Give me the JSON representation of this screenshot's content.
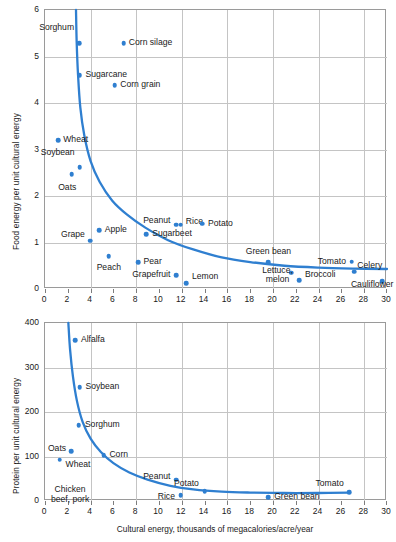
{
  "figure": {
    "background": "#ffffff",
    "accent": "#2f7fd0",
    "grid_color": "#c4c4c4",
    "axis_color": "#9a9a9a"
  },
  "chart_data": [
    {
      "id": "food-energy",
      "type": "scatter",
      "title": "",
      "xlabel": "",
      "ylabel": "Food energy per unit cultural energy",
      "xlim": [
        0,
        30
      ],
      "ylim": [
        0,
        6
      ],
      "xticks": [
        0,
        2,
        4,
        6,
        8,
        10,
        12,
        14,
        16,
        18,
        20,
        22,
        24,
        26,
        28,
        30
      ],
      "yticks": [
        0,
        1,
        2,
        3,
        4,
        5,
        6
      ],
      "grid": true,
      "legend": "none",
      "points": [
        {
          "label": "Sorghum",
          "x": 3.0,
          "y": 5.28,
          "lx": 2.55,
          "ly": 5.62,
          "align": "r"
        },
        {
          "label": "Corn silage",
          "x": 6.9,
          "y": 5.28,
          "lx": 7.35,
          "ly": 5.28,
          "align": "l"
        },
        {
          "label": "Sugarcane",
          "x": 3.05,
          "y": 4.6,
          "lx": 3.55,
          "ly": 4.6,
          "align": "l"
        },
        {
          "label": "Corn grain",
          "x": 6.1,
          "y": 4.38,
          "lx": 6.6,
          "ly": 4.38,
          "align": "l"
        },
        {
          "label": "Wheat",
          "x": 1.15,
          "y": 3.2,
          "lx": 1.6,
          "ly": 3.2,
          "align": "l"
        },
        {
          "label": "Soybean",
          "x": 3.05,
          "y": 2.62,
          "lx": 2.6,
          "ly": 2.93,
          "align": "r"
        },
        {
          "label": "Oats",
          "x": 2.35,
          "y": 2.47,
          "lx": 2.75,
          "ly": 2.18,
          "align": "r"
        },
        {
          "label": "Grape",
          "x": 3.95,
          "y": 1.04,
          "lx": 3.5,
          "ly": 1.16,
          "align": "r"
        },
        {
          "label": "Apple",
          "x": 4.75,
          "y": 1.26,
          "lx": 5.25,
          "ly": 1.26,
          "align": "l"
        },
        {
          "label": "Peanut",
          "x": 11.5,
          "y": 1.38,
          "lx": 11.0,
          "ly": 1.47,
          "align": "r"
        },
        {
          "label": "Sugarbeet",
          "x": 8.9,
          "y": 1.18,
          "lx": 9.4,
          "ly": 1.18,
          "align": "l"
        },
        {
          "label": "Rice",
          "x": 11.9,
          "y": 1.38,
          "lx": 12.35,
          "ly": 1.44,
          "align": "l"
        },
        {
          "label": "Potato",
          "x": 13.8,
          "y": 1.4,
          "lx": 14.3,
          "ly": 1.4,
          "align": "l"
        },
        {
          "label": "Peach",
          "x": 5.6,
          "y": 0.71,
          "lx": 5.6,
          "ly": 0.46,
          "align": "c"
        },
        {
          "label": "Pear",
          "x": 8.15,
          "y": 0.57,
          "lx": 8.65,
          "ly": 0.57,
          "align": "l"
        },
        {
          "label": "Grapefruit",
          "x": 11.5,
          "y": 0.3,
          "lx": 11.0,
          "ly": 0.3,
          "align": "r"
        },
        {
          "label": "Lemon",
          "x": 12.4,
          "y": 0.13,
          "lx": 12.9,
          "ly": 0.26,
          "align": "l"
        },
        {
          "label": "Green bean",
          "x": 19.6,
          "y": 0.57,
          "lx": 19.6,
          "ly": 0.79,
          "align": "c"
        },
        {
          "label": "Lettuce,\nmelon",
          "x": 21.6,
          "y": 0.35,
          "lx": 20.4,
          "ly": 0.31,
          "align": "c"
        },
        {
          "label": "Broccoli",
          "x": 22.3,
          "y": 0.19,
          "lx": 22.8,
          "ly": 0.31,
          "align": "l"
        },
        {
          "label": "Tomato",
          "x": 26.9,
          "y": 0.59,
          "lx": 26.4,
          "ly": 0.59,
          "align": "r"
        },
        {
          "label": "Celery",
          "x": 27.1,
          "y": 0.37,
          "lx": 27.4,
          "ly": 0.5,
          "align": "l"
        },
        {
          "label": "Cauliflower",
          "x": 29.6,
          "y": 0.17,
          "lx": 28.7,
          "ly": 0.08,
          "align": "c"
        }
      ],
      "curve": [
        {
          "x": 2.72,
          "y": 6.0
        },
        {
          "x": 2.78,
          "y": 5.3
        },
        {
          "x": 2.9,
          "y": 4.6
        },
        {
          "x": 3.1,
          "y": 3.9
        },
        {
          "x": 3.45,
          "y": 3.3
        },
        {
          "x": 4.0,
          "y": 2.75
        },
        {
          "x": 4.8,
          "y": 2.3
        },
        {
          "x": 5.9,
          "y": 1.9
        },
        {
          "x": 7.2,
          "y": 1.6
        },
        {
          "x": 8.8,
          "y": 1.32
        },
        {
          "x": 10.8,
          "y": 1.05
        },
        {
          "x": 13.0,
          "y": 0.85
        },
        {
          "x": 15.5,
          "y": 0.68
        },
        {
          "x": 18.0,
          "y": 0.58
        },
        {
          "x": 21.0,
          "y": 0.5
        },
        {
          "x": 24.0,
          "y": 0.46
        },
        {
          "x": 27.0,
          "y": 0.44
        },
        {
          "x": 30.0,
          "y": 0.43
        }
      ]
    },
    {
      "id": "protein",
      "type": "scatter",
      "title": "",
      "xlabel": "Cultural energy, thousands of megacalories/acre/year",
      "ylabel": "Protein per unit cultural energy",
      "xlim": [
        0,
        30
      ],
      "ylim": [
        0,
        400
      ],
      "xticks": [
        0,
        2,
        4,
        6,
        8,
        10,
        12,
        14,
        16,
        18,
        20,
        22,
        24,
        26,
        28,
        30
      ],
      "yticks": [
        0,
        100,
        200,
        300,
        400
      ],
      "grid": true,
      "legend": "none",
      "points": [
        {
          "label": "Alfalfa",
          "x": 2.65,
          "y": 362,
          "lx": 3.15,
          "ly": 362,
          "align": "l"
        },
        {
          "label": "Soybean",
          "x": 3.05,
          "y": 256,
          "lx": 3.55,
          "ly": 256,
          "align": "l"
        },
        {
          "label": "Sorghum",
          "x": 2.95,
          "y": 170,
          "lx": 3.5,
          "ly": 170,
          "align": "l"
        },
        {
          "label": "Oats",
          "x": 2.3,
          "y": 112,
          "lx": 1.85,
          "ly": 116,
          "align": "r"
        },
        {
          "label": "Wheat",
          "x": 1.3,
          "y": 93,
          "lx": 1.8,
          "ly": 80,
          "align": "l"
        },
        {
          "label": "Corn",
          "x": 5.15,
          "y": 103,
          "lx": 5.65,
          "ly": 103,
          "align": "l"
        },
        {
          "label": "Chicken\nbeef, pork",
          "x": -1,
          "y": -1,
          "lx": 2.2,
          "ly": 15,
          "align": "c"
        },
        {
          "label": "Peanut",
          "x": 11.5,
          "y": 48,
          "lx": 11.0,
          "ly": 55,
          "align": "r"
        },
        {
          "label": "Rice",
          "x": 11.9,
          "y": 13,
          "lx": 11.4,
          "ly": 9,
          "align": "r"
        },
        {
          "label": "Potato",
          "x": 14.0,
          "y": 22,
          "lx": 13.5,
          "ly": 39,
          "align": "r"
        },
        {
          "label": "Green bean",
          "x": 19.6,
          "y": 8,
          "lx": 20.1,
          "ly": 10,
          "align": "l"
        },
        {
          "label": "Tomato",
          "x": 26.7,
          "y": 20,
          "lx": 26.2,
          "ly": 38,
          "align": "r"
        }
      ],
      "curve": [
        {
          "x": 2.05,
          "y": 400
        },
        {
          "x": 2.2,
          "y": 340
        },
        {
          "x": 2.45,
          "y": 280
        },
        {
          "x": 2.8,
          "y": 225
        },
        {
          "x": 3.3,
          "y": 178
        },
        {
          "x": 4.0,
          "y": 140
        },
        {
          "x": 4.9,
          "y": 110
        },
        {
          "x": 6.0,
          "y": 85
        },
        {
          "x": 7.4,
          "y": 64
        },
        {
          "x": 9.0,
          "y": 48
        },
        {
          "x": 11.0,
          "y": 34
        },
        {
          "x": 13.0,
          "y": 26
        },
        {
          "x": 15.5,
          "y": 21
        },
        {
          "x": 18.0,
          "y": 19
        },
        {
          "x": 21.0,
          "y": 18
        },
        {
          "x": 24.0,
          "y": 18
        },
        {
          "x": 26.7,
          "y": 19
        }
      ]
    }
  ]
}
